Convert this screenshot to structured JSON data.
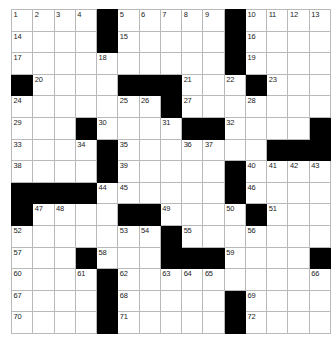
{
  "puzzle": {
    "title": "Crossword Grid",
    "rows": 15,
    "cols": 15,
    "colors": {
      "block": "#000000",
      "cell": "#ffffff",
      "gridline": "#b9b9b9",
      "number": "#222222"
    },
    "grid": [
      [
        {
          "block": false,
          "num": "1"
        },
        {
          "block": false,
          "num": "2"
        },
        {
          "block": false,
          "num": "3"
        },
        {
          "block": false,
          "num": "4"
        },
        {
          "block": true,
          "num": ""
        },
        {
          "block": false,
          "num": "5"
        },
        {
          "block": false,
          "num": "6"
        },
        {
          "block": false,
          "num": "7"
        },
        {
          "block": false,
          "num": "8"
        },
        {
          "block": false,
          "num": "9"
        },
        {
          "block": true,
          "num": ""
        },
        {
          "block": false,
          "num": "10"
        },
        {
          "block": false,
          "num": "11"
        },
        {
          "block": false,
          "num": "12"
        },
        {
          "block": false,
          "num": "13"
        }
      ],
      [
        {
          "block": false,
          "num": "14"
        },
        {
          "block": false,
          "num": ""
        },
        {
          "block": false,
          "num": ""
        },
        {
          "block": false,
          "num": ""
        },
        {
          "block": true,
          "num": ""
        },
        {
          "block": false,
          "num": "15"
        },
        {
          "block": false,
          "num": ""
        },
        {
          "block": false,
          "num": ""
        },
        {
          "block": false,
          "num": ""
        },
        {
          "block": false,
          "num": ""
        },
        {
          "block": true,
          "num": ""
        },
        {
          "block": false,
          "num": "16"
        },
        {
          "block": false,
          "num": ""
        },
        {
          "block": false,
          "num": ""
        },
        {
          "block": false,
          "num": ""
        }
      ],
      [
        {
          "block": false,
          "num": "17"
        },
        {
          "block": false,
          "num": ""
        },
        {
          "block": false,
          "num": ""
        },
        {
          "block": false,
          "num": ""
        },
        {
          "block": false,
          "num": "18"
        },
        {
          "block": false,
          "num": ""
        },
        {
          "block": false,
          "num": ""
        },
        {
          "block": false,
          "num": ""
        },
        {
          "block": false,
          "num": ""
        },
        {
          "block": false,
          "num": ""
        },
        {
          "block": true,
          "num": ""
        },
        {
          "block": false,
          "num": "19"
        },
        {
          "block": false,
          "num": ""
        },
        {
          "block": false,
          "num": ""
        },
        {
          "block": false,
          "num": ""
        }
      ],
      [
        {
          "block": true,
          "num": ""
        },
        {
          "block": false,
          "num": "20"
        },
        {
          "block": false,
          "num": ""
        },
        {
          "block": false,
          "num": ""
        },
        {
          "block": false,
          "num": ""
        },
        {
          "block": true,
          "num": ""
        },
        {
          "block": true,
          "num": ""
        },
        {
          "block": true,
          "num": ""
        },
        {
          "block": false,
          "num": "21"
        },
        {
          "block": false,
          "num": ""
        },
        {
          "block": false,
          "num": "22"
        },
        {
          "block": true,
          "num": ""
        },
        {
          "block": false,
          "num": "23"
        },
        {
          "block": false,
          "num": ""
        },
        {
          "block": false,
          "num": ""
        }
      ],
      [
        {
          "block": false,
          "num": "24"
        },
        {
          "block": false,
          "num": ""
        },
        {
          "block": false,
          "num": ""
        },
        {
          "block": false,
          "num": ""
        },
        {
          "block": false,
          "num": ""
        },
        {
          "block": false,
          "num": "25"
        },
        {
          "block": false,
          "num": "26"
        },
        {
          "block": true,
          "num": ""
        },
        {
          "block": false,
          "num": "27"
        },
        {
          "block": false,
          "num": ""
        },
        {
          "block": false,
          "num": ""
        },
        {
          "block": false,
          "num": "28"
        },
        {
          "block": false,
          "num": ""
        },
        {
          "block": false,
          "num": ""
        },
        {
          "block": false,
          "num": ""
        }
      ],
      [
        {
          "block": false,
          "num": "29"
        },
        {
          "block": false,
          "num": ""
        },
        {
          "block": false,
          "num": ""
        },
        {
          "block": true,
          "num": ""
        },
        {
          "block": false,
          "num": "30"
        },
        {
          "block": false,
          "num": ""
        },
        {
          "block": false,
          "num": ""
        },
        {
          "block": false,
          "num": "31"
        },
        {
          "block": true,
          "num": ""
        },
        {
          "block": true,
          "num": ""
        },
        {
          "block": false,
          "num": "32"
        },
        {
          "block": false,
          "num": ""
        },
        {
          "block": false,
          "num": ""
        },
        {
          "block": false,
          "num": ""
        },
        {
          "block": true,
          "num": ""
        }
      ],
      [
        {
          "block": false,
          "num": "33"
        },
        {
          "block": false,
          "num": ""
        },
        {
          "block": false,
          "num": ""
        },
        {
          "block": false,
          "num": "34"
        },
        {
          "block": true,
          "num": ""
        },
        {
          "block": false,
          "num": "35"
        },
        {
          "block": false,
          "num": ""
        },
        {
          "block": false,
          "num": ""
        },
        {
          "block": false,
          "num": "36"
        },
        {
          "block": false,
          "num": "37"
        },
        {
          "block": false,
          "num": ""
        },
        {
          "block": false,
          "num": ""
        },
        {
          "block": true,
          "num": ""
        },
        {
          "block": true,
          "num": ""
        },
        {
          "block": true,
          "num": ""
        }
      ],
      [
        {
          "block": false,
          "num": "38"
        },
        {
          "block": false,
          "num": ""
        },
        {
          "block": false,
          "num": ""
        },
        {
          "block": false,
          "num": ""
        },
        {
          "block": true,
          "num": ""
        },
        {
          "block": false,
          "num": "39"
        },
        {
          "block": false,
          "num": ""
        },
        {
          "block": false,
          "num": ""
        },
        {
          "block": false,
          "num": ""
        },
        {
          "block": false,
          "num": ""
        },
        {
          "block": true,
          "num": ""
        },
        {
          "block": false,
          "num": "40"
        },
        {
          "block": false,
          "num": "41"
        },
        {
          "block": false,
          "num": "42"
        },
        {
          "block": false,
          "num": "43"
        }
      ],
      [
        {
          "block": true,
          "num": ""
        },
        {
          "block": true,
          "num": ""
        },
        {
          "block": true,
          "num": ""
        },
        {
          "block": true,
          "num": ""
        },
        {
          "block": false,
          "num": "44"
        },
        {
          "block": false,
          "num": "45"
        },
        {
          "block": false,
          "num": ""
        },
        {
          "block": false,
          "num": ""
        },
        {
          "block": false,
          "num": ""
        },
        {
          "block": false,
          "num": ""
        },
        {
          "block": true,
          "num": ""
        },
        {
          "block": false,
          "num": "46"
        },
        {
          "block": false,
          "num": ""
        },
        {
          "block": false,
          "num": ""
        },
        {
          "block": false,
          "num": ""
        }
      ],
      [
        {
          "block": true,
          "num": ""
        },
        {
          "block": false,
          "num": "47"
        },
        {
          "block": false,
          "num": "48"
        },
        {
          "block": false,
          "num": ""
        },
        {
          "block": false,
          "num": ""
        },
        {
          "block": true,
          "num": ""
        },
        {
          "block": true,
          "num": ""
        },
        {
          "block": false,
          "num": "49"
        },
        {
          "block": false,
          "num": ""
        },
        {
          "block": false,
          "num": ""
        },
        {
          "block": false,
          "num": "50"
        },
        {
          "block": true,
          "num": ""
        },
        {
          "block": false,
          "num": "51"
        },
        {
          "block": false,
          "num": ""
        },
        {
          "block": false,
          "num": ""
        }
      ],
      [
        {
          "block": false,
          "num": "52"
        },
        {
          "block": false,
          "num": ""
        },
        {
          "block": false,
          "num": ""
        },
        {
          "block": false,
          "num": ""
        },
        {
          "block": false,
          "num": ""
        },
        {
          "block": false,
          "num": "53"
        },
        {
          "block": false,
          "num": "54"
        },
        {
          "block": true,
          "num": ""
        },
        {
          "block": false,
          "num": "55"
        },
        {
          "block": false,
          "num": ""
        },
        {
          "block": false,
          "num": ""
        },
        {
          "block": false,
          "num": "56"
        },
        {
          "block": false,
          "num": ""
        },
        {
          "block": false,
          "num": ""
        },
        {
          "block": false,
          "num": ""
        }
      ],
      [
        {
          "block": false,
          "num": "57"
        },
        {
          "block": false,
          "num": ""
        },
        {
          "block": false,
          "num": ""
        },
        {
          "block": true,
          "num": ""
        },
        {
          "block": false,
          "num": "58"
        },
        {
          "block": false,
          "num": ""
        },
        {
          "block": false,
          "num": ""
        },
        {
          "block": true,
          "num": ""
        },
        {
          "block": true,
          "num": ""
        },
        {
          "block": true,
          "num": ""
        },
        {
          "block": false,
          "num": "59"
        },
        {
          "block": false,
          "num": ""
        },
        {
          "block": false,
          "num": ""
        },
        {
          "block": false,
          "num": ""
        },
        {
          "block": true,
          "num": ""
        }
      ],
      [
        {
          "block": false,
          "num": "60"
        },
        {
          "block": false,
          "num": ""
        },
        {
          "block": false,
          "num": ""
        },
        {
          "block": false,
          "num": "61"
        },
        {
          "block": true,
          "num": ""
        },
        {
          "block": false,
          "num": "62"
        },
        {
          "block": false,
          "num": ""
        },
        {
          "block": false,
          "num": "63"
        },
        {
          "block": false,
          "num": "64"
        },
        {
          "block": false,
          "num": "65"
        },
        {
          "block": false,
          "num": ""
        },
        {
          "block": false,
          "num": ""
        },
        {
          "block": false,
          "num": ""
        },
        {
          "block": false,
          "num": ""
        },
        {
          "block": false,
          "num": "66"
        }
      ],
      [
        {
          "block": false,
          "num": "67"
        },
        {
          "block": false,
          "num": ""
        },
        {
          "block": false,
          "num": ""
        },
        {
          "block": false,
          "num": ""
        },
        {
          "block": true,
          "num": ""
        },
        {
          "block": false,
          "num": "68"
        },
        {
          "block": false,
          "num": ""
        },
        {
          "block": false,
          "num": ""
        },
        {
          "block": false,
          "num": ""
        },
        {
          "block": false,
          "num": ""
        },
        {
          "block": true,
          "num": ""
        },
        {
          "block": false,
          "num": "69"
        },
        {
          "block": false,
          "num": ""
        },
        {
          "block": false,
          "num": ""
        },
        {
          "block": false,
          "num": ""
        }
      ],
      [
        {
          "block": false,
          "num": "70"
        },
        {
          "block": false,
          "num": ""
        },
        {
          "block": false,
          "num": ""
        },
        {
          "block": false,
          "num": ""
        },
        {
          "block": true,
          "num": ""
        },
        {
          "block": false,
          "num": "71"
        },
        {
          "block": false,
          "num": ""
        },
        {
          "block": false,
          "num": ""
        },
        {
          "block": false,
          "num": ""
        },
        {
          "block": false,
          "num": ""
        },
        {
          "block": true,
          "num": ""
        },
        {
          "block": false,
          "num": "72"
        },
        {
          "block": false,
          "num": ""
        },
        {
          "block": false,
          "num": ""
        },
        {
          "block": false,
          "num": ""
        }
      ]
    ]
  }
}
